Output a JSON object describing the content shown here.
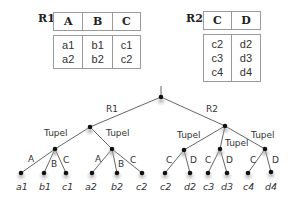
{
  "relations": {
    "r1": {
      "name": "R1",
      "columns": [
        "A",
        "B",
        "C"
      ],
      "rows": [
        [
          "a1",
          "b1",
          "c1"
        ],
        [
          "a2",
          "b2",
          "c2"
        ]
      ]
    },
    "r2": {
      "name": "R2",
      "columns": [
        "C",
        "D"
      ],
      "rows": [
        [
          "c2",
          "d2"
        ],
        [
          "c3",
          "d3"
        ],
        [
          "c4",
          "d4"
        ]
      ]
    }
  },
  "tree": {
    "branch_labels": {
      "r1": "R1",
      "r2": "R2"
    },
    "tuple_label": "Tupel",
    "r1_tuples": [
      {
        "edges": [
          "A",
          "B",
          "C"
        ],
        "leaves": [
          "a1",
          "b1",
          "c1"
        ]
      },
      {
        "edges": [
          "A",
          "B",
          "C"
        ],
        "leaves": [
          "a2",
          "b2",
          "c2"
        ]
      }
    ],
    "r2_tuples": [
      {
        "edges": [
          "C",
          "D"
        ],
        "leaves": [
          "c2",
          "d2"
        ]
      },
      {
        "edges": [
          "C",
          "D"
        ],
        "leaves": [
          "c3",
          "d3"
        ]
      },
      {
        "edges": [
          "C",
          "D"
        ],
        "leaves": [
          "c4",
          "d4"
        ]
      }
    ]
  },
  "colors": {
    "line": "#555555",
    "node": "#111111",
    "shadow": "#bbbbbb"
  }
}
